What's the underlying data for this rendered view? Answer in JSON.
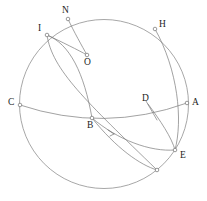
{
  "figure": {
    "type": "geometry-diagram",
    "width": 207,
    "height": 201,
    "background_color": "#ffffff",
    "stroke_color": "#7a7a7a",
    "label_color": "#1d1d1d"
  },
  "sphere": {
    "center_x": 104,
    "center_y": 104,
    "radius": 84.5
  },
  "labels": [
    {
      "id": "N",
      "text": "N",
      "x": 62,
      "y": 6
    },
    {
      "id": "I",
      "text": "I",
      "x": 38,
      "y": 24
    },
    {
      "id": "H",
      "text": "H",
      "x": 159,
      "y": 20
    },
    {
      "id": "O",
      "text": "O",
      "x": 84,
      "y": 58
    },
    {
      "id": "C",
      "text": "C",
      "x": 8,
      "y": 98
    },
    {
      "id": "D",
      "text": "D",
      "x": 142,
      "y": 94
    },
    {
      "id": "A",
      "text": "A",
      "x": 192,
      "y": 98
    },
    {
      "id": "B",
      "text": "B",
      "x": 87,
      "y": 121
    },
    {
      "id": "E",
      "text": "E",
      "x": 180,
      "y": 151
    }
  ],
  "markers": [
    {
      "id": "N",
      "cx": 68,
      "cy": 19,
      "r": 1.8
    },
    {
      "id": "I",
      "cx": 47,
      "cy": 35,
      "r": 1.8
    },
    {
      "id": "H",
      "cx": 155,
      "cy": 29,
      "r": 1.8
    },
    {
      "id": "O",
      "cx": 87,
      "cy": 55,
      "r": 1.8
    },
    {
      "id": "C",
      "cx": 20,
      "cy": 105,
      "r": 1.8
    },
    {
      "id": "A",
      "cx": 187,
      "cy": 103,
      "r": 1.8
    },
    {
      "id": "B",
      "cx": 92,
      "cy": 118,
      "r": 1.8
    },
    {
      "id": "E",
      "cx": 175,
      "cy": 150,
      "r": 1.8
    },
    {
      "id": "P1",
      "cx": 157,
      "cy": 170,
      "r": 1.8
    }
  ],
  "curves": [
    {
      "id": "equator",
      "d": "M 20 105 Q 104 133 187 103"
    },
    {
      "id": "equator-back",
      "d": "M 20 105 Q 104 78 187 103"
    },
    {
      "id": "arc-I-B-P1",
      "d": "M 47 35 C 52 70 86 101 157 170"
    },
    {
      "id": "arc-I-O-B-E",
      "d": "M 47 35 C 70 44 84 73 92 118"
    },
    {
      "id": "arc-B-E-lower",
      "d": "M 92 118 C 118 140 150 152 175 150"
    },
    {
      "id": "arc-B-P1-lower",
      "d": "M 92 118 C 116 148 140 165 157 170"
    },
    {
      "id": "arc-D-E",
      "d": "M 148 104 C 160 120 172 138 175 150"
    },
    {
      "id": "arc-H-E",
      "d": "M 155 29 C 178 70 183 120 175 150"
    },
    {
      "id": "arc-N-O",
      "d": "M 68 19 C 74 32 82 46 87 55"
    },
    {
      "id": "arc-I-O",
      "d": "M 47 35 C 62 42 78 50 87 55"
    },
    {
      "id": "leader-D",
      "d": "M 146 101 L 157 120"
    }
  ],
  "arrow": {
    "id": "flow-arrow",
    "d": "M 108 130 L 114 134 M 110 136 L 114 134"
  }
}
